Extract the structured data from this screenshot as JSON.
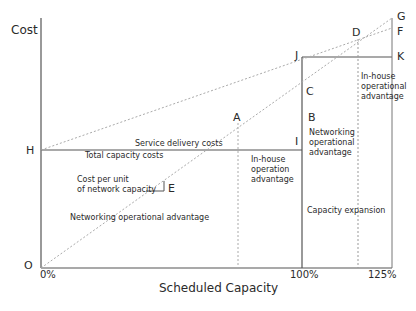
{
  "axes": {
    "y_label": "Cost",
    "x_label": "Scheduled Capacity",
    "x_ticks": [
      "0%",
      "100%",
      "125%"
    ]
  },
  "points": {
    "O": "O",
    "H": "H",
    "A": "A",
    "B": "B",
    "C": "C",
    "D": "D",
    "E": "E",
    "F": "F",
    "G": "G",
    "I": "I",
    "J": "J",
    "K": "K"
  },
  "annotations": {
    "service_delivery_costs": "Service delivery costs",
    "total_capacity_costs": "Total capacity costs",
    "cost_per_unit_line1": "Cost per unit",
    "cost_per_unit_line2": "of network capacity",
    "networking_advantage_left": "Networking operational advantage",
    "inhouse_operation_line1": "In-house",
    "inhouse_operation_line2": "operation",
    "inhouse_operation_line3": "advantage",
    "networking_advantage_line1": "Networking",
    "networking_advantage_line2": "operational",
    "networking_advantage_line3": "advantage",
    "inhouse_operational_line1": "In-house",
    "inhouse_operational_line2": "operational",
    "inhouse_operational_line3": "advantage",
    "capacity_expansion": "Capacity expansion"
  },
  "colors": {
    "solid_line": "#555555",
    "dotted_line": "#aaaaaa",
    "text": "#2a2a2a"
  }
}
